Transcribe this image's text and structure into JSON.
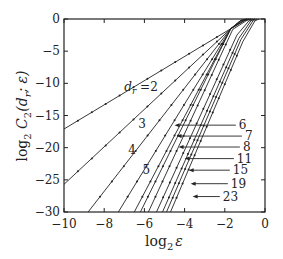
{
  "chart_data": {
    "type": "line",
    "title": "",
    "xlabel": "log2 ε",
    "ylabel": "log2 C2(dr; ε)",
    "xlim": [
      -10,
      0
    ],
    "ylim": [
      -30,
      0
    ],
    "xticks": [
      -10,
      -8,
      -6,
      -4,
      -2,
      0
    ],
    "yticks": [
      0,
      -5,
      -10,
      -15,
      -20,
      -25,
      -30
    ],
    "grid": false,
    "legend": "inline labels",
    "series": [
      {
        "name": "dr=2",
        "label": "dr =2",
        "points": [
          [
            -10,
            -17.1
          ],
          [
            -1.7,
            -1.5
          ],
          [
            -1.2,
            -0.3
          ],
          [
            -0.8,
            0
          ]
        ]
      },
      {
        "name": "dr=3",
        "label": "3",
        "points": [
          [
            -10,
            -25.7
          ],
          [
            -1.7,
            -1.5
          ],
          [
            -1.2,
            -0.2
          ],
          [
            -0.9,
            0
          ]
        ]
      },
      {
        "name": "dr=4",
        "label": "4",
        "points": [
          [
            -8.8,
            -30
          ],
          [
            -1.7,
            -1.5
          ],
          [
            -1.2,
            -0.2
          ],
          [
            -0.9,
            0
          ]
        ]
      },
      {
        "name": "dr=5",
        "label": "5",
        "points": [
          [
            -7.3,
            -30
          ],
          [
            -1.7,
            -1.5
          ],
          [
            -1.1,
            -0.2
          ],
          [
            -0.8,
            0
          ]
        ]
      },
      {
        "name": "dr=6",
        "label": "6",
        "points": [
          [
            -6.5,
            -30
          ],
          [
            -1.7,
            -1.5
          ],
          [
            -1.0,
            -0.2
          ],
          [
            -0.7,
            0
          ]
        ]
      },
      {
        "name": "dr=7",
        "label": "7",
        "points": [
          [
            -6.2,
            -30
          ],
          [
            -1.7,
            -1.5
          ],
          [
            -1.0,
            -0.2
          ],
          [
            -0.7,
            0
          ]
        ]
      },
      {
        "name": "dr=8",
        "label": "8",
        "points": [
          [
            -5.8,
            -30
          ],
          [
            -1.6,
            -1.6
          ],
          [
            -0.9,
            -0.2
          ],
          [
            -0.6,
            0
          ]
        ]
      },
      {
        "name": "dr=11",
        "label": "11",
        "points": [
          [
            -5.4,
            -30
          ],
          [
            -1.4,
            -2.5
          ],
          [
            -0.8,
            -0.3
          ],
          [
            -0.5,
            0
          ]
        ]
      },
      {
        "name": "dr=15",
        "label": "15",
        "points": [
          [
            -5.1,
            -30
          ],
          [
            -1.3,
            -3.0
          ],
          [
            -0.7,
            -0.3
          ],
          [
            -0.5,
            0
          ]
        ]
      },
      {
        "name": "dr=19",
        "label": "19",
        "points": [
          [
            -4.9,
            -30
          ],
          [
            -1.2,
            -3.2
          ],
          [
            -0.6,
            -0.3
          ],
          [
            -0.4,
            0
          ]
        ]
      },
      {
        "name": "dr=23",
        "label": "23",
        "points": [
          [
            -4.7,
            -30
          ],
          [
            -1.1,
            -3.5
          ],
          [
            -0.5,
            -0.3
          ],
          [
            -0.3,
            0
          ]
        ]
      }
    ],
    "annotations": [
      {
        "text": "dr =2",
        "x": -7.0,
        "y": -10.5
      },
      {
        "text": "3",
        "x": -6.3,
        "y": -16.3
      },
      {
        "text": "4",
        "x": -6.8,
        "y": -20.4
      },
      {
        "text": "5",
        "x": -6.1,
        "y": -23.4
      },
      {
        "text": "6",
        "x": -1.3,
        "y": -16.5,
        "arrow_to": [
          -4.5,
          -16.5
        ]
      },
      {
        "text": "7",
        "x": -1.0,
        "y": -18.2,
        "arrow_to": [
          -4.4,
          -18.2
        ]
      },
      {
        "text": "8",
        "x": -1.1,
        "y": -19.9,
        "arrow_to": [
          -4.3,
          -19.9
        ]
      },
      {
        "text": "11",
        "x": -1.4,
        "y": -21.7,
        "arrow_to": [
          -4.0,
          -21.7
        ]
      },
      {
        "text": "15",
        "x": -1.6,
        "y": -23.5,
        "arrow_to": [
          -3.8,
          -23.5
        ]
      },
      {
        "text": "19",
        "x": -1.7,
        "y": -25.6,
        "arrow_to": [
          -3.7,
          -25.6
        ]
      },
      {
        "text": "23",
        "x": -2.1,
        "y": -27.6,
        "arrow_to": [
          -3.6,
          -27.6
        ]
      }
    ]
  },
  "axes": {
    "xlabel_main": "log",
    "xlabel_sub": "2",
    "xlabel_var": "ε",
    "ylabel_main": "log",
    "ylabel_sub": "2",
    "ylabel_rest": " C",
    "ylabel_rest_sub": "2",
    "ylabel_args": "(d",
    "ylabel_args_sub": "r",
    "ylabel_tail": "; ε)"
  }
}
